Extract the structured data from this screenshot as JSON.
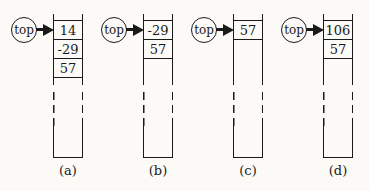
{
  "figure": {
    "background": "#fbfaf7",
    "line_color": "#1a1a1a",
    "pointer_label": "top",
    "stacks": [
      {
        "label": "(a)",
        "cells": [
          "14",
          "-29",
          "57"
        ]
      },
      {
        "label": "(b)",
        "cells": [
          "-29",
          "57"
        ]
      },
      {
        "label": "(c)",
        "cells": [
          "57"
        ]
      },
      {
        "label": "(d)",
        "cells": [
          "106",
          "57"
        ]
      }
    ]
  }
}
